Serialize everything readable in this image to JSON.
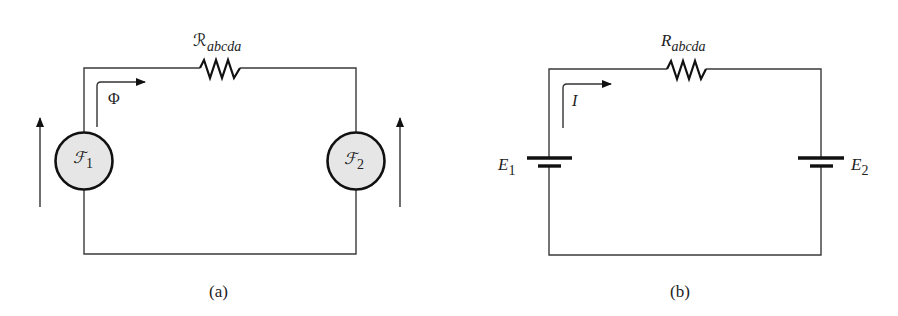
{
  "panels": {
    "a": {
      "caption": "(a)",
      "resistor": {
        "symbol": "ℛ",
        "subscript": "abcda"
      },
      "flux": {
        "label": "Φ"
      },
      "source1": {
        "symbol": "ℱ",
        "subscript": "1"
      },
      "source2": {
        "symbol": "ℱ",
        "subscript": "2"
      },
      "colors": {
        "source_fill": "#e6e6e6",
        "stroke": "#111111"
      }
    },
    "b": {
      "caption": "(b)",
      "resistor": {
        "symbol": "R",
        "subscript": "abcda"
      },
      "current": {
        "label": "I"
      },
      "battery1": {
        "symbol": "E",
        "subscript": "1"
      },
      "battery2": {
        "symbol": "E",
        "subscript": "2"
      }
    }
  }
}
